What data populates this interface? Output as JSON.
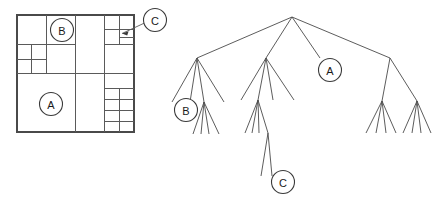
{
  "figure": {
    "colors": {
      "line": "#5a5a5a",
      "outline": "#4a4a4a",
      "edge": "#4a4a4a",
      "marker_stroke": "#3a3a3a",
      "marker_fill": "#ffffff",
      "text": "#1a1a1a",
      "background": "#ffffff"
    }
  },
  "markers": {
    "a": "A",
    "b": "B",
    "c": "C"
  },
  "quadtree_panel": {
    "name": "spatial-decomposition",
    "outline": {
      "x": 17,
      "y": 15,
      "width": 117,
      "height": 117
    },
    "lines": [
      {
        "name": "half-vertical",
        "x1": 75.5,
        "y1": 15,
        "x2": 75.5,
        "y2": 132
      },
      {
        "name": "half-horizontal",
        "x1": 17,
        "y1": 73.5,
        "x2": 134,
        "y2": 73.5
      },
      {
        "name": "tl-quad-vertical",
        "x1": 46.5,
        "y1": 15,
        "x2": 46.5,
        "y2": 73.5
      },
      {
        "name": "tl-quad-horizontal",
        "x1": 17,
        "y1": 44.5,
        "x2": 75.5,
        "y2": 44.5
      },
      {
        "name": "tl-bl-sub-vertical",
        "x1": 31.5,
        "y1": 44.5,
        "x2": 31.5,
        "y2": 73.5
      },
      {
        "name": "tl-bl-sub-horizontal",
        "x1": 17,
        "y1": 59.5,
        "x2": 46.5,
        "y2": 59.5
      },
      {
        "name": "tr-quad-vertical",
        "x1": 104.5,
        "y1": 15,
        "x2": 104.5,
        "y2": 73.5
      },
      {
        "name": "tr-quad-horizontal",
        "x1": 104.5,
        "y1": 44.5,
        "x2": 134,
        "y2": 44.5
      },
      {
        "name": "tr-tr-sub-vertical",
        "x1": 119.5,
        "y1": 15,
        "x2": 119.5,
        "y2": 44.5
      },
      {
        "name": "tr-tr-sub-horizontal",
        "x1": 104.5,
        "y1": 29.5,
        "x2": 134,
        "y2": 29.5
      },
      {
        "name": "tr-tr-leaf-horizontal",
        "x1": 119.5,
        "y1": 37.0,
        "x2": 134,
        "y2": 37.0
      },
      {
        "name": "br-quad-vertical",
        "x1": 104.5,
        "y1": 73.5,
        "x2": 104.5,
        "y2": 132
      },
      {
        "name": "br-quad-horizontal",
        "x1": 104.5,
        "y1": 88.5,
        "x2": 134,
        "y2": 88.5
      },
      {
        "name": "br-sub-vertical",
        "x1": 119.5,
        "y1": 88.5,
        "x2": 119.5,
        "y2": 132
      },
      {
        "name": "br-sub-horizontal-1",
        "x1": 104.5,
        "y1": 99.5,
        "x2": 134,
        "y2": 99.5
      },
      {
        "name": "br-sub-horizontal-2",
        "x1": 104.5,
        "y1": 110.5,
        "x2": 134,
        "y2": 110.5
      },
      {
        "name": "br-sub-horizontal-3",
        "x1": 104.5,
        "y1": 121.5,
        "x2": 134,
        "y2": 121.5
      }
    ],
    "marker_a": {
      "cx": 51,
      "cy": 104,
      "r": 11.5
    },
    "marker_b": {
      "cx": 62,
      "cy": 30,
      "r": 11.5
    },
    "marker_c": {
      "cx": 155,
      "cy": 20,
      "r": 11.5
    },
    "callout_c": {
      "line": {
        "x1": 144.5,
        "y1": 23,
        "x2": 122,
        "y2": 33.5
      },
      "arrow": "M 122,33.5 L 128.6,31.3 L 127.2,35.6 Z"
    }
  },
  "tree_panel": {
    "name": "quadtree-graph",
    "root": {
      "x": 292,
      "y": 17
    },
    "level1": [
      {
        "name": "child-1",
        "x": 197,
        "y": 58
      },
      {
        "name": "child-2",
        "x": 266,
        "y": 58
      },
      {
        "name": "child-3-leaf",
        "x": 320,
        "y": 58
      },
      {
        "name": "child-4",
        "x": 390,
        "y": 58
      }
    ],
    "subtree_1": {
      "parent": {
        "x": 197,
        "y": 58
      },
      "children": [
        {
          "x": 172,
          "y": 102
        },
        {
          "x": 190,
          "y": 102
        },
        {
          "x": 204,
          "y": 102
        },
        {
          "x": 224,
          "y": 102
        }
      ],
      "expanded_child": {
        "x": 204,
        "y": 102
      },
      "grandchildren": [
        {
          "x": 193,
          "y": 134
        },
        {
          "x": 201,
          "y": 134
        },
        {
          "x": 209,
          "y": 134
        },
        {
          "x": 219,
          "y": 134
        }
      ]
    },
    "subtree_2": {
      "parent": {
        "x": 266,
        "y": 58
      },
      "children": [
        {
          "x": 241,
          "y": 100
        },
        {
          "x": 258,
          "y": 100
        },
        {
          "x": 273,
          "y": 100
        },
        {
          "x": 294,
          "y": 100
        }
      ],
      "expanded_child": {
        "x": 258,
        "y": 100
      },
      "grandchildren": [
        {
          "x": 245,
          "y": 133
        },
        {
          "x": 252,
          "y": 133
        },
        {
          "x": 259,
          "y": 133
        },
        {
          "x": 268,
          "y": 133
        }
      ],
      "deep_parent": {
        "x": 268,
        "y": 133
      },
      "deep_children": [
        {
          "x": 261,
          "y": 176
        },
        {
          "x": 272,
          "y": 176
        }
      ]
    },
    "subtree_4": {
      "parent": {
        "x": 390,
        "y": 58
      },
      "children": [
        {
          "x": 382,
          "y": 101
        },
        {
          "x": 417,
          "y": 101
        }
      ],
      "leaves_left": [
        {
          "x": 366,
          "y": 133
        },
        {
          "x": 376,
          "y": 133
        },
        {
          "x": 386,
          "y": 133
        },
        {
          "x": 396,
          "y": 133
        }
      ],
      "leaves_right": [
        {
          "x": 403,
          "y": 133
        },
        {
          "x": 412,
          "y": 133
        },
        {
          "x": 421,
          "y": 133
        },
        {
          "x": 431,
          "y": 133
        }
      ]
    },
    "marker_a": {
      "cx": 330,
      "cy": 70,
      "r": 11.5
    },
    "marker_b": {
      "cx": 186,
      "cy": 110,
      "r": 11.5
    },
    "marker_c": {
      "cx": 283,
      "cy": 182,
      "r": 11.5
    }
  }
}
